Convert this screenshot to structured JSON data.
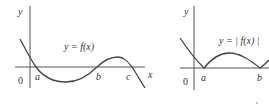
{
  "figures": [
    {
      "id": "a",
      "formula": "y = f(x)",
      "y_axis_label": "y",
      "x_axis_label": "x",
      "origin_label": "0",
      "root_labels": [
        "a",
        "b",
        "c"
      ],
      "caption": "a"
    },
    {
      "id": "b",
      "formula": "y = | f(x) |",
      "y_axis_label": "y",
      "origin_label": "0",
      "root_labels": [
        "a",
        "b"
      ],
      "caption": "b"
    }
  ]
}
